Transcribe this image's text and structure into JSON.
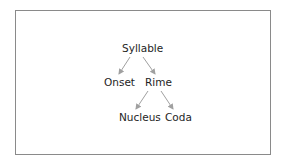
{
  "diagram": {
    "type": "tree",
    "nodes": {
      "root": "Syllable",
      "onset": "Onset",
      "rime": "Rime",
      "nucleus": "Nucleus",
      "coda": "Coda"
    },
    "edges": [
      {
        "from": "Syllable",
        "to": "Onset"
      },
      {
        "from": "Syllable",
        "to": "Rime"
      },
      {
        "from": "Rime",
        "to": "Nucleus"
      },
      {
        "from": "Rime",
        "to": "Coda"
      }
    ],
    "colors": {
      "border": "#8a8a8a",
      "arrow": "#a0a0a0",
      "text": "#1e1e1e"
    }
  }
}
